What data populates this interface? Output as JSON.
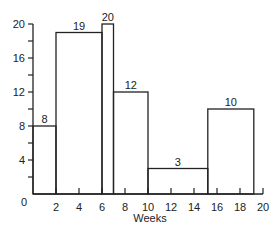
{
  "chart_data": {
    "type": "bar",
    "subtype": "histogram",
    "title": "",
    "xlabel": "Weeks",
    "ylabel": "",
    "xlim": [
      0,
      20
    ],
    "ylim": [
      0,
      20
    ],
    "x_ticks": [
      "0",
      "2",
      "4",
      "6",
      "8",
      "10",
      "12",
      "14",
      "16",
      "18",
      "20"
    ],
    "y_ticks": [
      "0",
      "4",
      "8",
      "12",
      "16",
      "20"
    ],
    "grid": false,
    "legend": null,
    "bins": [
      {
        "start": 0,
        "end": 2,
        "value": 8,
        "label": "8"
      },
      {
        "start": 2,
        "end": 6,
        "value": 19,
        "label": "19"
      },
      {
        "start": 6,
        "end": 7,
        "value": 20,
        "label": "20"
      },
      {
        "start": 7,
        "end": 10,
        "value": 12,
        "label": "12"
      },
      {
        "start": 10,
        "end": 15.2,
        "value": 3,
        "label": "3"
      },
      {
        "start": 15.2,
        "end": 19.2,
        "value": 10,
        "label": "10"
      }
    ]
  },
  "colors": {
    "line": "#222222",
    "background": "#ffffff"
  }
}
